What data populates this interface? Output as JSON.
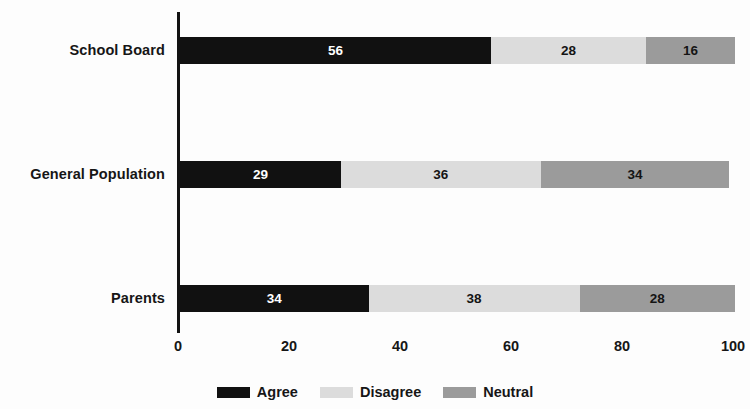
{
  "chart_data": {
    "type": "bar",
    "orientation": "horizontal",
    "stacked": true,
    "title": "",
    "subtitle": "",
    "xlabel": "",
    "ylabel": "",
    "categories": [
      "School Board",
      "General Population",
      "Parents"
    ],
    "series": [
      {
        "name": "Agree",
        "color": "#111111",
        "values": [
          56,
          29,
          34
        ]
      },
      {
        "name": "Disagree",
        "color": "#dcdcdc",
        "values": [
          28,
          36,
          38
        ]
      },
      {
        "name": "Neutral",
        "color": "#9b9b9b",
        "values": [
          16,
          34,
          28
        ]
      }
    ],
    "xlim": [
      0,
      100
    ],
    "xticks": [
      0,
      20,
      40,
      60,
      80,
      100
    ],
    "xtick_labels": [
      "0",
      "20",
      "40",
      "60",
      "80",
      "100"
    ],
    "grid": false,
    "legend_position": "bottom",
    "bar_label_format": "value",
    "bars": [
      {
        "category": "School Board",
        "segments": [
          {
            "series": "Agree",
            "value": 56,
            "label": "56"
          },
          {
            "series": "Disagree",
            "value": 28,
            "label": "28"
          },
          {
            "series": "Neutral",
            "value": 16,
            "label": "16"
          }
        ]
      },
      {
        "category": "General Population",
        "segments": [
          {
            "series": "Agree",
            "value": 29,
            "label": "29"
          },
          {
            "series": "Disagree",
            "value": 36,
            "label": "36"
          },
          {
            "series": "Neutral",
            "value": 34,
            "label": "34"
          }
        ]
      },
      {
        "category": "Parents",
        "segments": [
          {
            "series": "Agree",
            "value": 34,
            "label": "34"
          },
          {
            "series": "Disagree",
            "value": 38,
            "label": "38"
          },
          {
            "series": "Neutral",
            "value": 28,
            "label": "28"
          }
        ]
      }
    ]
  },
  "legend": {
    "items": [
      {
        "label": "Agree",
        "color": "#111111"
      },
      {
        "label": "Disagree",
        "color": "#dcdcdc"
      },
      {
        "label": "Neutral",
        "color": "#9b9b9b"
      }
    ]
  },
  "colors": {
    "background": "#fdfdfd",
    "axis": "#121212",
    "text": "#161616",
    "agree": "#111111",
    "disagree": "#dcdcdc",
    "neutral": "#9b9b9b"
  }
}
